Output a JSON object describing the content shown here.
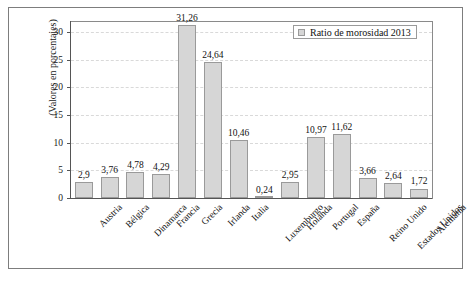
{
  "chart_data": {
    "type": "bar",
    "title": "",
    "subtitle": "",
    "xlabel": "",
    "ylabel": "(Valores en porcentajes)",
    "ylim": [
      0,
      32
    ],
    "yticks": [
      0,
      5,
      10,
      15,
      20,
      25,
      30
    ],
    "ytick_labels": [
      "0",
      "5",
      "10",
      "15",
      "20",
      "25",
      "30"
    ],
    "grid": "horizontal-dashed",
    "legend_position": "top-right",
    "legend": [
      "Ratio de morosidad 2013"
    ],
    "categories": [
      "Austria",
      "Bélgica",
      "Dinamarca",
      "Francia",
      "Grecia",
      "Irlanda",
      "Italia",
      "Luxemburgo",
      "Holanda",
      "Portugal",
      "España",
      "Reino Unido",
      "Estados Unidos",
      "Alemania"
    ],
    "series": [
      {
        "name": "Ratio de morosidad 2013",
        "color": "#d6d6d6",
        "values": [
          2.9,
          3.76,
          4.78,
          4.29,
          31.26,
          24.64,
          10.46,
          0.24,
          2.95,
          10.97,
          11.62,
          3.66,
          2.64,
          1.72
        ],
        "data_labels": [
          "2,9",
          "3,76",
          "4,78",
          "4,29",
          "31,26",
          "24,64",
          "10,46",
          "0,24",
          "2,95",
          "10,97",
          "11,62",
          "3,66",
          "2,64",
          "1,72"
        ]
      }
    ]
  },
  "colors": {
    "bar_fill": "#d6d6d6",
    "bar_stroke": "#9a9a9a",
    "gridline": "#d9d9d9",
    "axis": "#555555",
    "frame": "#7d7d7d",
    "background": "#ffffff",
    "text": "#111111"
  }
}
